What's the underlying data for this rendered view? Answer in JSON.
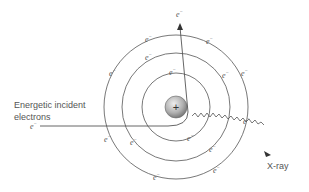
{
  "diagram": {
    "title": "",
    "labels": {
      "incident_line1": "Energetic incident",
      "incident_line2": "electrons",
      "incident_electron": "e",
      "ejected_electron": "e",
      "xray": "X-ray",
      "nucleus_sign": "+",
      "electron_symbol": "e",
      "electron_charge": "−"
    },
    "colors": {
      "stroke": "#555555",
      "text": "#555555",
      "nucleus_light": "#e6e6e6",
      "nucleus_dark": "#8a8a8a"
    },
    "nucleus": {
      "cx": 176,
      "cy": 107,
      "r": 11
    },
    "shells": [
      {
        "name": "inner",
        "r": 34
      },
      {
        "name": "middle",
        "r": 54
      },
      {
        "name": "outer",
        "r": 72
      }
    ]
  }
}
